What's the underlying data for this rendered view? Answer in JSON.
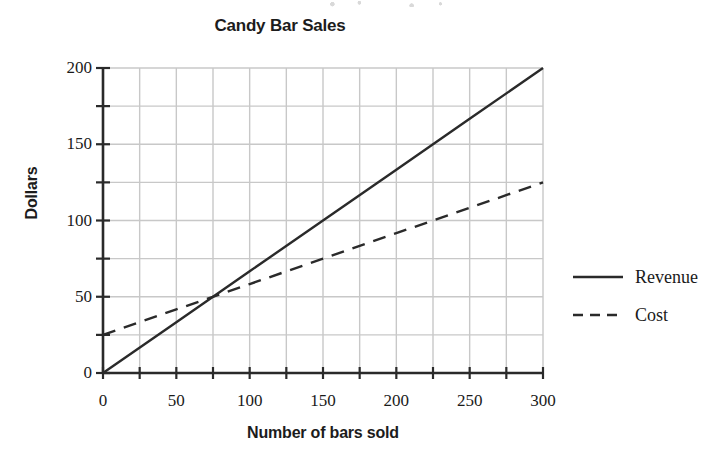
{
  "chart_data": {
    "type": "line",
    "title": "Candy Bar Sales",
    "xlabel": "Number of bars sold",
    "ylabel": "Dollars",
    "xlim": [
      0,
      300
    ],
    "ylim": [
      0,
      200
    ],
    "x_major_ticks": [
      0,
      50,
      100,
      150,
      200,
      250,
      300
    ],
    "y_major_ticks": [
      0,
      50,
      100,
      150,
      200
    ],
    "x_minor_step": 25,
    "y_minor_step": 25,
    "x_tick_labels": [
      "0",
      "50",
      "100",
      "150",
      "200",
      "250",
      "300"
    ],
    "y_tick_labels": [
      "0",
      "50",
      "100",
      "150",
      "200"
    ],
    "grid": true,
    "grid_color": "#c8c8c8",
    "axis_color": "#2a2a2a",
    "legend_position": "right",
    "series": [
      {
        "name": "Revenue",
        "style": "solid",
        "color": "#2a2a2a",
        "x": [
          0,
          50,
          100,
          150,
          200,
          250,
          300
        ],
        "values": [
          0,
          33.3,
          66.7,
          100,
          133.3,
          166.7,
          200
        ],
        "intercept": 0,
        "slope": 0.6667
      },
      {
        "name": "Cost",
        "style": "dashed",
        "color": "#2a2a2a",
        "x": [
          0,
          50,
          100,
          150,
          200,
          250,
          300
        ],
        "values": [
          25,
          41.7,
          58.3,
          75,
          91.7,
          108.3,
          125
        ],
        "intercept": 25,
        "slope": 0.3333
      }
    ],
    "annotations": [
      {
        "name": "break-even",
        "x": 75,
        "y": 50
      }
    ]
  },
  "legend": {
    "items": [
      {
        "label": "Revenue",
        "style": "solid"
      },
      {
        "label": "Cost",
        "style": "dashed"
      }
    ]
  }
}
